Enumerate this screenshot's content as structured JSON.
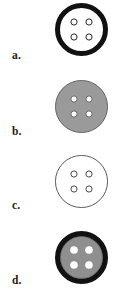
{
  "figure": {
    "name": "button-variants-figure",
    "width": 127,
    "height": 308,
    "background": "#ffffff"
  },
  "palette": {
    "black": "#111111",
    "outline": "#3a3a3a",
    "gray_fill": "#9a9a9a",
    "gray_fill_dark": "#8f8f8f",
    "white": "#ffffff",
    "label_color": "#1a1a1a"
  },
  "geometry": {
    "button_diameter": 53,
    "button_center_x": 81,
    "hole_radius": 3.1,
    "hole_offset": 7.5,
    "row_height": 77
  },
  "items": [
    {
      "id": "button-a",
      "label": "a.",
      "label_y": 50,
      "row_top": 0,
      "style": "thick-black-ring-white-center",
      "rim_color": "#111111",
      "rim_width": 5.0,
      "face_color": "#ffffff",
      "hole_fill": "#ffffff",
      "hole_stroke": "#2a2a2a",
      "hole_stroke_width": 1.0,
      "has_inner_outline": false,
      "description": "Bold black outer rim with plain white face and four small dark-rimmed holes"
    },
    {
      "id": "button-b",
      "label": "b.",
      "label_y": 126,
      "row_top": 77,
      "style": "solid-gray-disk",
      "rim_color": "#5a5a5a",
      "rim_width": 0.9,
      "face_color": "#9a9a9a",
      "hole_fill": "#ffffff",
      "hole_stroke": "#6d6d6d",
      "hole_stroke_width": 1.0,
      "has_inner_outline": false,
      "description": "Flat mid-gray disk with a thin darker edge and four white holes"
    },
    {
      "id": "button-c",
      "label": "c.",
      "label_y": 200,
      "row_top": 152,
      "style": "outline-only-white",
      "rim_color": "#4a4a4a",
      "rim_width": 0.9,
      "face_color": "#ffffff",
      "hole_fill": "#ffffff",
      "hole_stroke": "#4a4a4a",
      "hole_stroke_width": 1.0,
      "has_inner_outline": false,
      "description": "Plain white circle drawn as a thin outline with four outlined holes"
    },
    {
      "id": "button-d",
      "label": "d.",
      "label_y": 275,
      "row_top": 228,
      "style": "thick-black-ring-gray-center",
      "rim_color": "#111111",
      "rim_width": 5.4,
      "face_color": "#8f8f8f",
      "hole_fill": "#ffffff",
      "hole_stroke": "#ffffff",
      "hole_stroke_width": 1.4,
      "has_inner_outline": true,
      "description": "Bold black outer rim enclosing a gray face with four white-ringed holes"
    }
  ]
}
